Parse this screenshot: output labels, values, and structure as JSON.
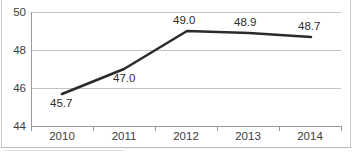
{
  "chart_data": {
    "type": "line",
    "title": "",
    "xlabel": "",
    "ylabel": "",
    "categories": [
      "2010",
      "2011",
      "2012",
      "2013",
      "2014"
    ],
    "values": [
      45.7,
      47.0,
      49.0,
      48.9,
      48.7
    ],
    "data_labels": [
      "45.7",
      "47.0",
      "49.0",
      "48.9",
      "48.7"
    ],
    "series": [
      {
        "name": "",
        "values": [
          45.7,
          47.0,
          49.0,
          48.9,
          48.7
        ],
        "color": "#2b2b2b"
      }
    ],
    "ylim": [
      44,
      50
    ],
    "yticks": [
      44,
      46,
      48,
      50
    ],
    "ytick_labels": [
      "44",
      "46",
      "48",
      "50"
    ],
    "grid": true,
    "legend": "none",
    "gridline_color": "#c6c4c0",
    "axis_color": "#9a9a9a",
    "text_color": "#3d3d3d",
    "line_color": "#2b2b2b",
    "background": "#ffffff"
  },
  "axes": {
    "y_ticks": [
      {
        "label": "50",
        "top": 7
      },
      {
        "label": "48",
        "top": 45
      },
      {
        "label": "46",
        "top": 83
      },
      {
        "label": "44",
        "top": 121
      }
    ],
    "x_ticks": [
      {
        "label": "2010",
        "left": 31
      },
      {
        "label": "2011",
        "left": 93
      },
      {
        "label": "2012",
        "left": 155
      },
      {
        "label": "2013",
        "left": 217
      },
      {
        "label": "2014",
        "left": 279
      }
    ]
  },
  "points": [
    {
      "label": "45.7",
      "cx": 62,
      "cy": 94,
      "label_left": 50,
      "label_top": 98
    },
    {
      "label": "47.0",
      "cx": 124,
      "cy": 69,
      "label_left": 113,
      "label_top": 73
    },
    {
      "label": "49.0",
      "cx": 187,
      "cy": 31,
      "label_left": 173,
      "label_top": 15
    },
    {
      "label": "48.9",
      "cx": 249,
      "cy": 33,
      "label_left": 234,
      "label_top": 17
    },
    {
      "label": "48.7",
      "cx": 311,
      "cy": 37,
      "label_left": 298,
      "label_top": 21
    }
  ],
  "gridlines": [
    {
      "top": 0
    },
    {
      "top": 38
    },
    {
      "top": 76
    },
    {
      "top": 114
    }
  ]
}
